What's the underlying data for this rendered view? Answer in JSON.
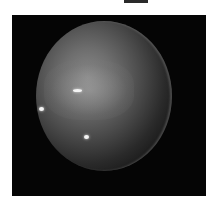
{
  "image": {
    "subject": "planet",
    "description": "Grayscale telescope image of a banded gas-giant planet with three bright spots on a black background",
    "colors": {
      "background": "#050505",
      "page": "#ffffff",
      "planet_light": "#8a8a8a",
      "planet_dark": "#121212",
      "spot": "#f4f4f4"
    },
    "features": [
      {
        "name": "bright-spot-center",
        "x": 79,
        "y": 90
      },
      {
        "name": "bright-spot-left-limb",
        "x": 41,
        "y": 108
      },
      {
        "name": "bright-spot-lower",
        "x": 86,
        "y": 137
      }
    ]
  }
}
